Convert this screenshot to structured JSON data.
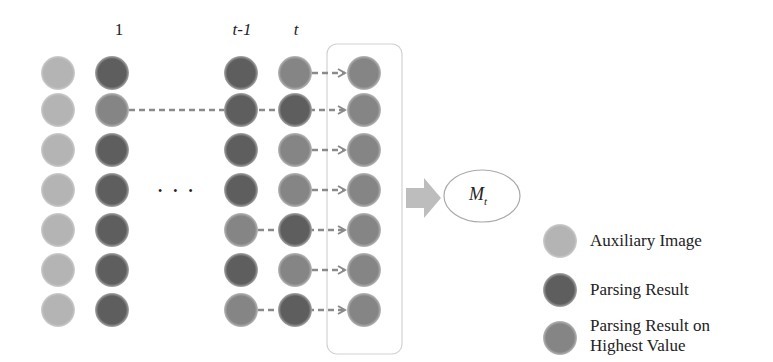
{
  "column_labels": {
    "first": "1",
    "prev": "t-1",
    "current": "t"
  },
  "ellipsis": "• • •",
  "model": {
    "symbol": "M",
    "subscript": "t"
  },
  "colors": {
    "auxiliary": "#b4b4b4",
    "parsing_result": "#5e5e5e",
    "highest_value": "#858585",
    "dashed_line": "#8a8a8a",
    "box_border": "#cfcfcf",
    "big_arrow": "#bdbdbd"
  },
  "legend": [
    {
      "label": "Auxiliary Image",
      "kind": "auxiliary"
    },
    {
      "label": "Parsing Result",
      "kind": "parsing_result"
    },
    {
      "label": "Parsing Result on\nHighest Value",
      "kind": "highest_value"
    }
  ],
  "grid": {
    "rows": 7,
    "columns": [
      {
        "name": "auxiliary",
        "cells": [
          "auxiliary",
          "auxiliary",
          "auxiliary",
          "auxiliary",
          "auxiliary",
          "auxiliary",
          "auxiliary"
        ]
      },
      {
        "name": "step-1",
        "cells": [
          "parsing_result",
          "highest_value",
          "parsing_result",
          "parsing_result",
          "parsing_result",
          "parsing_result",
          "parsing_result"
        ]
      },
      {
        "name": "step-t-minus-1",
        "cells": [
          "parsing_result",
          "parsing_result",
          "parsing_result",
          "parsing_result",
          "highest_value",
          "parsing_result",
          "highest_value"
        ]
      },
      {
        "name": "step-t",
        "cells": [
          "highest_value",
          "parsing_result",
          "highest_value",
          "highest_value",
          "parsing_result",
          "highest_value",
          "parsing_result"
        ]
      },
      {
        "name": "selected",
        "cells": [
          "highest_value",
          "highest_value",
          "highest_value",
          "highest_value",
          "highest_value",
          "highest_value",
          "highest_value"
        ]
      }
    ],
    "selection_source": [
      "t",
      "1",
      "t",
      "t",
      "t-1",
      "t",
      "t-1"
    ]
  }
}
